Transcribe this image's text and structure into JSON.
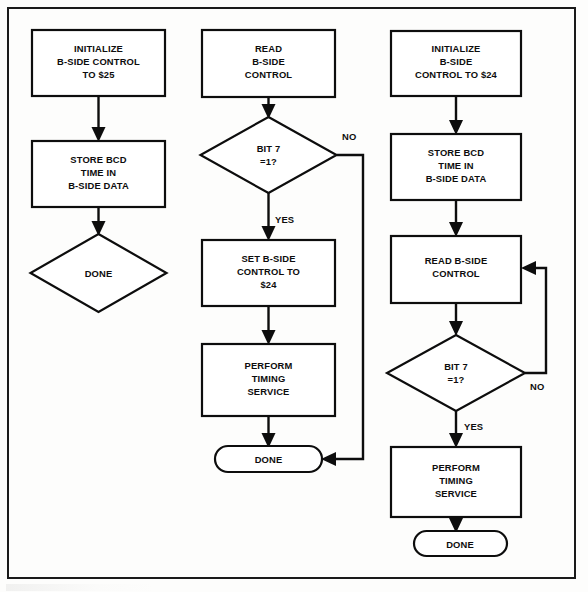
{
  "figure": {
    "background_color": "#fdfdfc",
    "line_color": "#0d0d0d",
    "frame": {
      "x": 8,
      "y": 8,
      "width": 567,
      "height": 570
    }
  },
  "columns": [
    {
      "id": "left",
      "name": "initialize-and-store",
      "nodes": [
        {
          "id": "left-init",
          "type": "process",
          "lines": [
            "INITIALIZE",
            "B-SIDE CONTROL",
            "TO $25"
          ],
          "x": 32,
          "y": 30,
          "width": 133,
          "height": 66
        },
        {
          "id": "left-store",
          "type": "process",
          "lines": [
            "STORE BCD",
            "TIME IN",
            "B-SIDE DATA"
          ],
          "x": 32,
          "y": 141,
          "width": 133,
          "height": 66
        },
        {
          "id": "left-done",
          "type": "decision",
          "lines": [
            "DONE"
          ],
          "cx": 98,
          "cy": 273,
          "rx": 68,
          "ry": 39
        }
      ]
    },
    {
      "id": "middle",
      "name": "read-test-and-service",
      "nodes": [
        {
          "id": "mid-read",
          "type": "process",
          "lines": [
            "READ",
            "B-SIDE",
            "CONTROL"
          ],
          "x": 202,
          "y": 30,
          "width": 133,
          "height": 67
        },
        {
          "id": "mid-bit7",
          "type": "decision",
          "lines": [
            "BIT 7",
            "=1?"
          ],
          "cx": 266,
          "cy": 155,
          "rx": 69,
          "ry": 38
        },
        {
          "id": "mid-set",
          "type": "process",
          "lines": [
            "SET B-SIDE",
            "CONTROL TO",
            "$24"
          ],
          "x": 202,
          "y": 240,
          "width": 133,
          "height": 66
        },
        {
          "id": "mid-perform",
          "type": "process",
          "lines": [
            "PERFORM",
            "TIMING",
            "SERVICE"
          ],
          "x": 202,
          "y": 344,
          "width": 133,
          "height": 72
        },
        {
          "id": "mid-done",
          "type": "terminator",
          "lines": [
            "DONE"
          ],
          "x": 215,
          "y": 446,
          "width": 107,
          "height": 26
        }
      ],
      "edge_labels": [
        {
          "id": "mid-no",
          "text": "NO",
          "x": 342,
          "y": 140
        },
        {
          "id": "mid-yes",
          "text": "YES",
          "x": 275,
          "y": 223
        }
      ]
    },
    {
      "id": "right",
      "name": "init-store-poll-and-service",
      "nodes": [
        {
          "id": "right-init",
          "type": "process",
          "lines": [
            "INITIALIZE",
            "B-SIDE",
            "CONTROL TO $24"
          ],
          "x": 391,
          "y": 31,
          "width": 130,
          "height": 65
        },
        {
          "id": "right-store",
          "type": "process",
          "lines": [
            "STORE BCD",
            "TIME IN",
            "B-SIDE DATA"
          ],
          "x": 391,
          "y": 134,
          "width": 130,
          "height": 66
        },
        {
          "id": "right-read",
          "type": "process",
          "lines": [
            "READ B-SIDE",
            "CONTROL"
          ],
          "x": 391,
          "y": 236,
          "width": 130,
          "height": 67
        },
        {
          "id": "right-bit7",
          "type": "decision",
          "lines": [
            "BIT 7",
            "=1?"
          ],
          "cx": 456,
          "cy": 373,
          "rx": 69,
          "ry": 38
        },
        {
          "id": "right-perform",
          "type": "process",
          "lines": [
            "PERFORM",
            "TIMING",
            "SERVICE"
          ],
          "x": 391,
          "y": 447,
          "width": 130,
          "height": 70
        },
        {
          "id": "right-done",
          "type": "terminator",
          "lines": [
            "DONE"
          ],
          "x": 414,
          "y": 531,
          "width": 93,
          "height": 25
        }
      ],
      "edge_labels": [
        {
          "id": "right-no",
          "text": "NO",
          "x": 534,
          "y": 381
        },
        {
          "id": "right-yes",
          "text": "YES",
          "x": 466,
          "y": 428
        }
      ]
    }
  ]
}
